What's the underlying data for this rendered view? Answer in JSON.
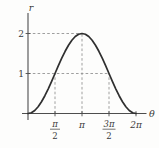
{
  "colors": {
    "background": "#fdfdfc",
    "curve": "#2f2f2f",
    "axis": "#4d4d4d",
    "dashed_guide": "#949494",
    "text": "#3a3a3a"
  },
  "chart_data": {
    "type": "line",
    "title": "",
    "xlabel": "θ",
    "ylabel": "r",
    "x_axis_unit": "θ in multiples of π/2 (u = θ / (π/2))",
    "x_range_u": [
      0,
      4
    ],
    "r_range": [
      0,
      2
    ],
    "grid": "off",
    "key_points": [
      {
        "theta": "0",
        "r": 0
      },
      {
        "theta": "π/2",
        "r": 1
      },
      {
        "theta": "π",
        "r": 2
      },
      {
        "theta": "3π/2",
        "r": 1
      },
      {
        "theta": "2π",
        "r": 0
      }
    ],
    "samples_u_r": [
      [
        0,
        0
      ],
      [
        0.125,
        0.0192
      ],
      [
        0.25,
        0.0761
      ],
      [
        0.375,
        0.1685
      ],
      [
        0.5,
        0.2929
      ],
      [
        0.625,
        0.4444
      ],
      [
        0.75,
        0.6173
      ],
      [
        0.875,
        0.8049
      ],
      [
        1,
        1
      ],
      [
        1.125,
        1.1951
      ],
      [
        1.25,
        1.3827
      ],
      [
        1.375,
        1.5556
      ],
      [
        1.5,
        1.7071
      ],
      [
        1.625,
        1.8315
      ],
      [
        1.75,
        1.9239
      ],
      [
        1.875,
        1.9808
      ],
      [
        2,
        2
      ],
      [
        2.125,
        1.9808
      ],
      [
        2.25,
        1.9239
      ],
      [
        2.375,
        1.8315
      ],
      [
        2.5,
        1.7071
      ],
      [
        2.625,
        1.5556
      ],
      [
        2.75,
        1.3827
      ],
      [
        2.875,
        1.1951
      ],
      [
        3,
        1
      ],
      [
        3.125,
        0.8049
      ],
      [
        3.25,
        0.6173
      ],
      [
        3.375,
        0.4444
      ],
      [
        3.5,
        0.2929
      ],
      [
        3.625,
        0.1685
      ],
      [
        3.75,
        0.0761
      ],
      [
        3.875,
        0.0192
      ],
      [
        4,
        0
      ]
    ],
    "x_ticks": [
      {
        "u": 1,
        "type": "fraction",
        "num": "π",
        "den": "2"
      },
      {
        "u": 2,
        "type": "plain",
        "label": "π"
      },
      {
        "u": 3,
        "type": "fraction",
        "num": "3π",
        "den": "2"
      },
      {
        "u": 4,
        "type": "plain",
        "label": "2π"
      }
    ],
    "y_ticks": [
      {
        "r": 1,
        "label": "1"
      },
      {
        "r": 2,
        "label": "2"
      }
    ],
    "dashed_guides": [
      {
        "orient": "h",
        "r": 2,
        "u_from": 0,
        "u_to": 2
      },
      {
        "orient": "h",
        "r": 1,
        "u_from": 0,
        "u_to": 3
      },
      {
        "orient": "v",
        "u": 1,
        "r_from": 0,
        "r_to": 1
      },
      {
        "orient": "v",
        "u": 2,
        "r_from": 0,
        "r_to": 2
      },
      {
        "orient": "v",
        "u": 3,
        "r_from": 0,
        "r_to": 1
      }
    ],
    "legend": "none"
  }
}
